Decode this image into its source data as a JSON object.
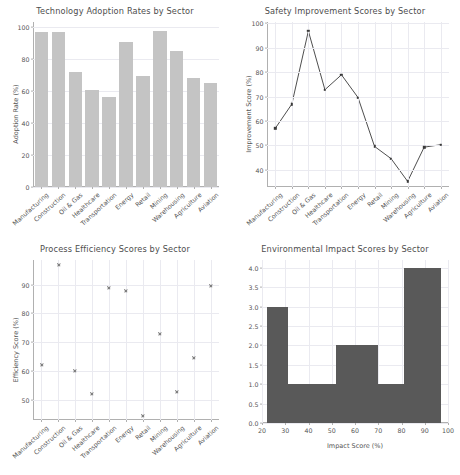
{
  "figure": {
    "background": "#ffffff",
    "text_color": "#555555",
    "grid_color": "#eaeaf0"
  },
  "chart_data": [
    {
      "panel": "top-left",
      "type": "bar",
      "title": "Technology Adoption Rates by Sector",
      "xlabel": "",
      "ylabel": "Adoption Rate (%)",
      "categories": [
        "Manufacturing",
        "Construction",
        "Oil & Gas",
        "Healthcare",
        "Transportation",
        "Energy",
        "Retail",
        "Mining",
        "Warehousing",
        "Agriculture",
        "Aviation"
      ],
      "values": [
        96.8,
        96.8,
        71.6,
        60.5,
        56.5,
        90.5,
        69.2,
        97.2,
        84.8,
        67.8,
        64.8
      ],
      "ylim": [
        0,
        103
      ],
      "yticks": [
        0,
        20,
        40,
        60,
        80,
        100
      ],
      "bar_color": "#c4c4c4",
      "grid": true,
      "legend": "none"
    },
    {
      "panel": "top-right",
      "type": "line",
      "title": "Safety Improvement Scores by Sector",
      "xlabel": "",
      "ylabel": "Improvement Score (%)",
      "categories": [
        "Manufacturing",
        "Construction",
        "Oil & Gas",
        "Healthcare",
        "Transportation",
        "Energy",
        "Retail",
        "Mining",
        "Warehousing",
        "Agriculture",
        "Aviation"
      ],
      "values": [
        57.0,
        66.9,
        96.8,
        72.8,
        78.9,
        69.6,
        49.6,
        44.6,
        35.3,
        49.3,
        50.3
      ],
      "ylim": [
        33.0,
        100.5
      ],
      "yticks": [
        40,
        50,
        60,
        70,
        80,
        90,
        100
      ],
      "line_color": "#3a3a3a",
      "marker": "square",
      "grid": true,
      "legend": "none"
    },
    {
      "panel": "bottom-left",
      "type": "scatter",
      "title": "Process Efficiency Scores by Sector",
      "xlabel": "",
      "ylabel": "Efficiency Score (%)",
      "categories": [
        "Manufacturing",
        "Construction",
        "Oil & Gas",
        "Healthcare",
        "Transportation",
        "Energy",
        "Retail",
        "Mining",
        "Warehousing",
        "Agriculture",
        "Aviation"
      ],
      "values": [
        62.0,
        96.7,
        60.0,
        51.9,
        88.9,
        87.9,
        44.3,
        72.8,
        52.6,
        64.5,
        89.6
      ],
      "ylim": [
        43.0,
        98.5
      ],
      "yticks": [
        50,
        60,
        70,
        80,
        90
      ],
      "marker": "x",
      "marker_color": "#737373",
      "grid": true,
      "legend": "none"
    },
    {
      "panel": "bottom-right",
      "type": "bar",
      "title": "Environmental Impact Scores by Sector",
      "xlabel": "Impact Score (%)",
      "ylabel": "",
      "subtype": "histogram",
      "bin_edges": [
        22,
        31,
        52,
        70,
        81,
        97
      ],
      "bin_counts": [
        3,
        1,
        2,
        1,
        4
      ],
      "xlim": [
        20,
        100
      ],
      "xticks": [
        20,
        30,
        40,
        50,
        60,
        70,
        80,
        90,
        100
      ],
      "ylim": [
        0,
        4.2
      ],
      "yticks": [
        "0.0",
        "0.5",
        "1.0",
        "1.5",
        "2.0",
        "2.5",
        "3.0",
        "3.5",
        "4.0"
      ],
      "ytick_values": [
        0.0,
        0.5,
        1.0,
        1.5,
        2.0,
        2.5,
        3.0,
        3.5,
        4.0
      ],
      "bar_color": "#595959",
      "grid": true,
      "legend": "none"
    }
  ]
}
